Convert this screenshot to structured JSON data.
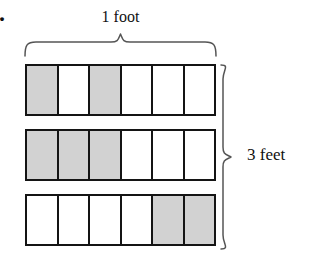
{
  "figure": {
    "problem_number": "0.",
    "width_label": "1 foot",
    "height_label": "3 feet",
    "colors": {
      "shaded_cell": "#d2d2d2",
      "unshaded_cell": "#ffffff",
      "border": "#141414",
      "background": "#ffffff",
      "brace": "#555555"
    },
    "grid": {
      "rows": 3,
      "columns": 6,
      "rows_data": [
        {
          "row_label": "row-1",
          "shaded_count": 2,
          "cells": [
            "shaded",
            "unshaded",
            "shaded",
            "unshaded",
            "unshaded",
            "unshaded"
          ]
        },
        {
          "row_label": "row-2",
          "shaded_count": 3,
          "cells": [
            "shaded",
            "shaded",
            "shaded",
            "unshaded",
            "unshaded",
            "unshaded"
          ]
        },
        {
          "row_label": "row-3",
          "shaded_count": 2,
          "cells": [
            "unshaded",
            "unshaded",
            "unshaded",
            "unshaded",
            "shaded",
            "shaded"
          ]
        }
      ]
    }
  }
}
